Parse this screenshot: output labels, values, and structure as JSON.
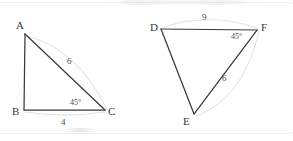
{
  "figure": {
    "background_color": "#ffffff",
    "ink_color": "#3a3a3c",
    "ghost_color": "#e2e2e4",
    "triangles": [
      {
        "id": "abc",
        "name": "triangle-abc",
        "vertices": [
          {
            "key": "A",
            "label": "A",
            "x": 25,
            "y": 34,
            "label_x": 16,
            "label_y": 20
          },
          {
            "key": "B",
            "label": "B",
            "x": 24,
            "y": 110,
            "label_x": 12,
            "label_y": 106
          },
          {
            "key": "C",
            "label": "C",
            "x": 105,
            "y": 110,
            "label_x": 108,
            "label_y": 106
          }
        ],
        "side_labels": [
          {
            "key": "AC",
            "value": "6",
            "x": 67,
            "y": 57
          },
          {
            "key": "BC",
            "value": "4",
            "x": 61,
            "y": 118
          }
        ],
        "angle_labels": [
          {
            "key": "C",
            "value": "45°",
            "x": 70,
            "y": 99
          }
        ]
      },
      {
        "id": "def",
        "name": "triangle-def",
        "vertices": [
          {
            "key": "D",
            "label": "D",
            "x": 161,
            "y": 29,
            "label_x": 150,
            "label_y": 22
          },
          {
            "key": "E",
            "label": "E",
            "x": 194,
            "y": 114,
            "label_x": 183,
            "label_y": 116
          },
          {
            "key": "F",
            "label": "F",
            "x": 257,
            "y": 30,
            "label_x": 261,
            "label_y": 22
          }
        ],
        "side_labels": [
          {
            "key": "DF",
            "value": "9",
            "x": 202,
            "y": 13
          },
          {
            "key": "EF",
            "value": "6",
            "x": 222,
            "y": 74
          }
        ],
        "angle_labels": [
          {
            "key": "F",
            "value": "45°",
            "x": 231,
            "y": 33
          }
        ]
      }
    ]
  }
}
